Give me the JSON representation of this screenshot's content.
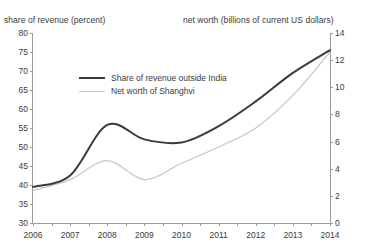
{
  "chart_data": {
    "type": "line",
    "title": "",
    "xlabel": "",
    "ylabel_left": "share of revenue (percent)",
    "ylabel_right": "net worth (billions of current US dollars)",
    "x": [
      2006,
      2007,
      2008,
      2009,
      2010,
      2011,
      2012,
      2013,
      2014
    ],
    "xticklabels": [
      "2006",
      "2007",
      "2008",
      "2009",
      "2010",
      "2011",
      "2012",
      "2013",
      "2014"
    ],
    "xlim": [
      2006,
      2014
    ],
    "ylim_left": [
      30,
      80
    ],
    "ylim_right": [
      0,
      14
    ],
    "yticks_left": [
      30,
      35,
      40,
      45,
      50,
      55,
      60,
      65,
      70,
      75,
      80
    ],
    "yticks_right": [
      0,
      2,
      4,
      6,
      8,
      10,
      12,
      14
    ],
    "yticklabels_left": [
      "30",
      "35",
      "40",
      "45",
      "50",
      "55",
      "60",
      "65",
      "70",
      "75",
      "80"
    ],
    "yticklabels_right": [
      "0",
      "2",
      "4",
      "6",
      "8",
      "10",
      "12",
      "14"
    ],
    "grid": false,
    "legend_position": "upper left",
    "series": [
      {
        "name": "Share of revenue outside India",
        "axis": "left",
        "color": "#3a3a3a",
        "linewidth": 2,
        "values": [
          39.5,
          42.5,
          55.8,
          52.0,
          51.2,
          55.5,
          62.0,
          69.5,
          75.5
        ]
      },
      {
        "name": "Net worth of Shanghvi",
        "axis": "right",
        "color": "#c6c6c6",
        "linewidth": 1.2,
        "values": [
          2.4,
          3.2,
          4.6,
          3.2,
          4.4,
          5.6,
          7.0,
          9.4,
          12.6
        ]
      }
    ]
  },
  "legend": {
    "items": [
      {
        "label": "Share of revenue outside India"
      },
      {
        "label": "Net worth of Shanghvi"
      }
    ]
  }
}
